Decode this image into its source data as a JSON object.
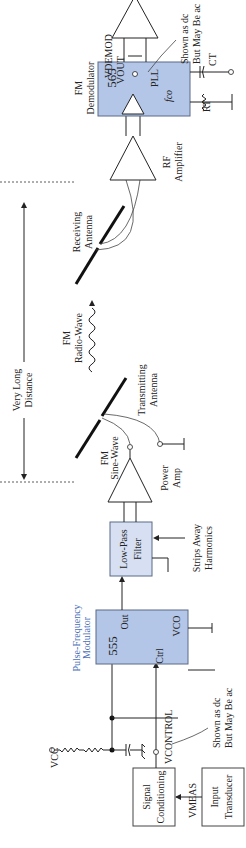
{
  "diagram": {
    "colors": {
      "chip_fill": "#b4c6e7",
      "filter_fill": "#d7e0f2",
      "accent_label": "#4a6fb8"
    },
    "labels": {
      "vout": "VOUT",
      "vout_note_1": "Shown as dc",
      "vout_note_2": "But May Be ac",
      "vdemod": "VDEMOD",
      "fm_demod_1": "FM",
      "fm_demod_2": "Demodulator",
      "chip_565": "565",
      "pll": "PLL",
      "fco": "fco",
      "ct": "CT",
      "rt": "RT",
      "rf_amp_1": "RF",
      "rf_amp_2": "Amplifier",
      "rx_ant_1": "Receiving",
      "rx_ant_2": "Antenna",
      "distance_1": "Very Long",
      "distance_2": "Distance",
      "radio_1": "FM",
      "radio_2": "Radio-Wave",
      "tx_ant_1": "Transmitting",
      "tx_ant_2": "Antenna",
      "fm_sine_1": "FM",
      "fm_sine_2": "Sine-Wave",
      "power_amp_1": "Power",
      "power_amp_2": "Amp",
      "lpf_1": "Low-Pass",
      "lpf_2": "Filter",
      "strips_1": "Strips Away",
      "strips_2": "Harmonics",
      "pfm_1": "Pulse-Frequency",
      "pfm_2": "Modulator",
      "chip_555": "555",
      "out": "Out",
      "ctrl": "Ctrl",
      "vco": "VCO",
      "vcc": "VCC",
      "vcontrol": "VCONTROL",
      "vc_note_1": "Shown as dc",
      "vc_note_2": "But May Be ac",
      "sig_cond_1": "Signal",
      "sig_cond_2": "Conditioning",
      "vmeas": "VMEAS",
      "transducer_1": "Input",
      "transducer_2": "Transducer"
    }
  }
}
